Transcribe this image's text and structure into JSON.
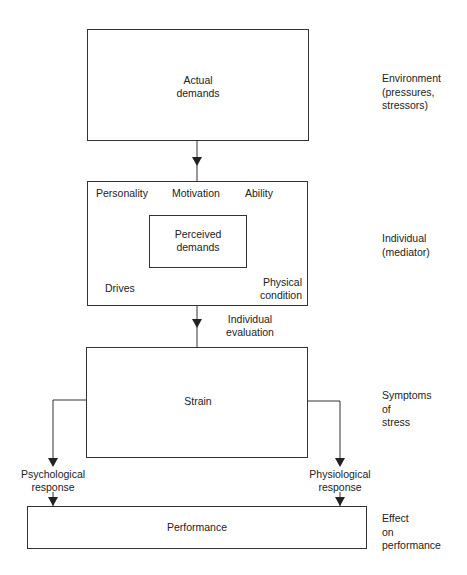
{
  "boxes": {
    "actual_demands": "Actual\ndemands",
    "perceived_demands": "Perceived\ndemands",
    "strain": "Strain",
    "performance": "Performance"
  },
  "mediators": {
    "personality": "Personality",
    "motivation": "Motivation",
    "ability": "Ability",
    "drives": "Drives",
    "physical_condition": "Physical\ncondition"
  },
  "flow_labels": {
    "individual_evaluation": "Individual\nevaluation",
    "psychological_response": "Psychological\nresponse",
    "physiological_response": "Physiological\nresponse"
  },
  "side_labels": {
    "environment": "Environment\n(pressures,\nstressors)",
    "individual": "Individual\n(mediator)",
    "symptoms": "Symptoms\nof\nstress",
    "effect": "Effect\non\nperformance"
  },
  "colors": {
    "line": "#333333",
    "text": "#222222",
    "background": "#ffffff"
  }
}
